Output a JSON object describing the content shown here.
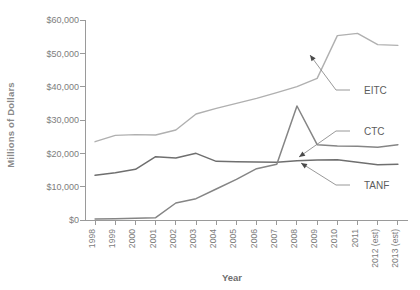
{
  "chart_data": {
    "type": "line",
    "title": "",
    "xlabel": "Year",
    "ylabel": "Millions of Dollars",
    "x": [
      "1998",
      "1999",
      "2000",
      "2001",
      "2002",
      "2003",
      "2004",
      "2005",
      "2006",
      "2007",
      "2008",
      "2009",
      "2010",
      "2011",
      "2012 (est)",
      "2013 (est)"
    ],
    "xtick_labels": [
      "1998",
      "1999",
      "2000",
      "2001",
      "2002",
      "2003",
      "2004",
      "2005",
      "2006",
      "2007",
      "2008",
      "2009",
      "2010",
      "2011",
      "2012 (est)",
      "2013 (est)"
    ],
    "ytick_labels": [
      "$0",
      "$10,000",
      "$20,000",
      "$30,000",
      "$40,000",
      "$50,000",
      "$60,000"
    ],
    "ytick_values": [
      0,
      10000,
      20000,
      30000,
      40000,
      50000,
      60000
    ],
    "ylim": [
      0,
      60000
    ],
    "grid": false,
    "legend_position": "inline-annotations",
    "series": [
      {
        "name": "EITC",
        "color": "#b0b0b0",
        "values": [
          23500,
          25400,
          25600,
          25500,
          27000,
          31800,
          33500,
          35000,
          36500,
          38200,
          40000,
          42500,
          55300,
          56000,
          52600,
          52400
        ]
      },
      {
        "name": "TANF",
        "color": "#6f6f6f",
        "values": [
          13400,
          14200,
          15200,
          19000,
          18600,
          20000,
          17600,
          17500,
          17400,
          17300,
          17800,
          18000,
          18100,
          17300,
          16600,
          16700
        ]
      },
      {
        "name": "CTC",
        "color": "#858585",
        "values": [
          300,
          400,
          500,
          700,
          5100,
          6400,
          9300,
          12200,
          15400,
          16700,
          34200,
          22600,
          22200,
          22100,
          21800,
          22600
        ]
      }
    ],
    "annotations": [
      {
        "label": "EITC",
        "target_x": "2010",
        "target_y": 50500
      },
      {
        "label": "CTC",
        "target_x": "2009",
        "target_y": 22600
      },
      {
        "label": "TANF",
        "target_x": "2010",
        "target_y": 18100
      }
    ]
  }
}
